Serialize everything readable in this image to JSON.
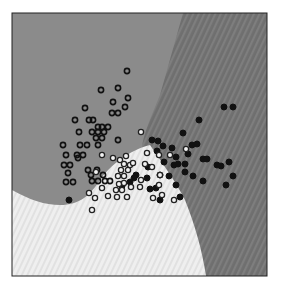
{
  "chart_data": {
    "type": "scatter",
    "title": "",
    "subtitle": "Classifier decision regions with training points",
    "xlabel": "",
    "ylabel": "",
    "grid": false,
    "legend": null,
    "frame": {
      "x": 12,
      "y": 13,
      "w": 255,
      "h": 263
    },
    "regions": [
      {
        "name": "class-A-region",
        "color": "#8a8a8a",
        "pattern": "flat"
      },
      {
        "name": "class-B-region",
        "color": "#707070",
        "pattern": "diagonal-stripes"
      },
      {
        "name": "class-C-region",
        "color": "#ececec",
        "pattern": "light-diagonal-stripes"
      }
    ],
    "series": [
      {
        "name": "class-A (hollow dark rings)",
        "marker": "ring-dark",
        "points": [
          [
            127,
            71
          ],
          [
            118,
            88
          ],
          [
            101,
            90
          ],
          [
            128,
            98
          ],
          [
            113,
            102
          ],
          [
            125,
            107
          ],
          [
            85,
            108
          ],
          [
            112,
            113
          ],
          [
            118,
            113
          ],
          [
            75,
            120
          ],
          [
            89,
            120
          ],
          [
            93,
            120
          ],
          [
            98,
            127
          ],
          [
            102,
            127
          ],
          [
            108,
            127
          ],
          [
            92,
            132
          ],
          [
            98,
            132
          ],
          [
            104,
            132
          ],
          [
            79,
            132
          ],
          [
            96,
            138
          ],
          [
            102,
            138
          ],
          [
            80,
            145
          ],
          [
            87,
            145
          ],
          [
            98,
            145
          ],
          [
            118,
            140
          ],
          [
            63,
            145
          ],
          [
            66,
            155
          ],
          [
            77,
            155
          ],
          [
            83,
            155
          ],
          [
            78,
            158
          ],
          [
            64,
            165
          ],
          [
            70,
            165
          ],
          [
            68,
            173
          ],
          [
            88,
            170
          ],
          [
            91,
            175
          ],
          [
            97,
            170
          ],
          [
            92,
            181
          ],
          [
            98,
            181
          ],
          [
            105,
            181
          ],
          [
            110,
            181
          ],
          [
            73,
            182
          ],
          [
            66,
            182
          ],
          [
            103,
            175
          ]
        ]
      },
      {
        "name": "class-B (filled dark)",
        "marker": "filled-dark",
        "points": [
          [
            224,
            107
          ],
          [
            233,
            107
          ],
          [
            199,
            120
          ],
          [
            183,
            133
          ],
          [
            152,
            140
          ],
          [
            158,
            141
          ],
          [
            163,
            146
          ],
          [
            157,
            151
          ],
          [
            192,
            145
          ],
          [
            197,
            144
          ],
          [
            172,
            148
          ],
          [
            188,
            154
          ],
          [
            176,
            157
          ],
          [
            203,
            159
          ],
          [
            207,
            159
          ],
          [
            174,
            165
          ],
          [
            178,
            164
          ],
          [
            185,
            164
          ],
          [
            164,
            162
          ],
          [
            217,
            165
          ],
          [
            221,
            166
          ],
          [
            185,
            172
          ],
          [
            193,
            176
          ],
          [
            203,
            181
          ],
          [
            226,
            185
          ],
          [
            176,
            185
          ],
          [
            169,
            176
          ],
          [
            160,
            175
          ],
          [
            148,
            167
          ],
          [
            147,
            178
          ],
          [
            136,
            175
          ],
          [
            134,
            178
          ],
          [
            150,
            189
          ],
          [
            156,
            188
          ],
          [
            160,
            200
          ],
          [
            180,
            197
          ],
          [
            233,
            176
          ],
          [
            229,
            162
          ],
          [
            122,
            186
          ],
          [
            69,
            200
          ],
          [
            130,
            182
          ]
        ]
      },
      {
        "name": "class-C (hollow light rings)",
        "marker": "ring-light",
        "points": [
          [
            141,
            132
          ],
          [
            170,
            155
          ],
          [
            159,
            155
          ],
          [
            186,
            149
          ],
          [
            120,
            160
          ],
          [
            126,
            156
          ],
          [
            124,
            164
          ],
          [
            130,
            165
          ],
          [
            121,
            170
          ],
          [
            128,
            170
          ],
          [
            118,
            176
          ],
          [
            124,
            176
          ],
          [
            119,
            184
          ],
          [
            124,
            183
          ],
          [
            116,
            190
          ],
          [
            122,
            190
          ],
          [
            117,
            197
          ],
          [
            127,
            197
          ],
          [
            131,
            187
          ],
          [
            140,
            187
          ],
          [
            145,
            164
          ],
          [
            152,
            167
          ],
          [
            141,
            180
          ],
          [
            160,
            175
          ],
          [
            102,
            155
          ],
          [
            113,
            158
          ],
          [
            96,
            172
          ],
          [
            102,
            188
          ],
          [
            108,
            196
          ],
          [
            92,
            210
          ],
          [
            162,
            195
          ],
          [
            174,
            200
          ],
          [
            95,
            198
          ],
          [
            89,
            193
          ],
          [
            159,
            185
          ],
          [
            153,
            198
          ],
          [
            133,
            163
          ],
          [
            147,
            153
          ]
        ]
      }
    ]
  }
}
